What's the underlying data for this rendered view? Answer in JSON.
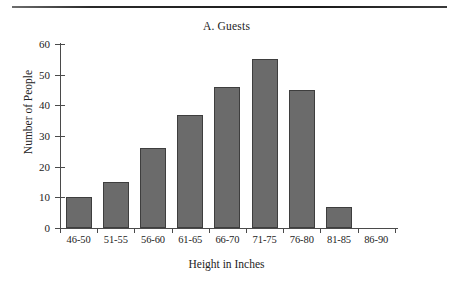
{
  "figure": {
    "title": "A. Guests",
    "background": "#ffffff",
    "bar_fill": "#6b6b6b",
    "bar_edge": "#3e3e3e",
    "axis_color": "#4a4a4a",
    "text_color": "#232323"
  },
  "chart_data": {
    "type": "bar",
    "title": "A. Guests",
    "xlabel": "Height in Inches",
    "ylabel": "Number of People",
    "categories": [
      "46-50",
      "51-55",
      "56-60",
      "61-65",
      "66-70",
      "71-75",
      "76-80",
      "81-85",
      "86-90"
    ],
    "values": [
      10,
      15,
      26,
      37,
      46,
      55,
      45,
      7,
      0
    ],
    "ylim": [
      0,
      60
    ],
    "yticks": [
      0,
      10,
      20,
      30,
      40,
      50,
      60
    ],
    "ytick_labels": [
      "0",
      "10",
      "20",
      "30",
      "40",
      "50",
      "60"
    ],
    "grid": false,
    "legend": false
  }
}
